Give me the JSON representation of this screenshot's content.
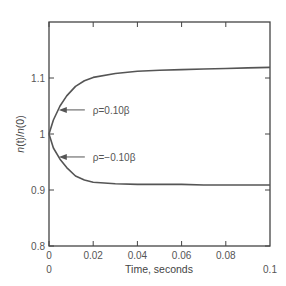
{
  "chart_data": {
    "type": "line",
    "title": "",
    "xlabel": "Time, seconds",
    "ylabel": "n(t)/n(0)",
    "xlim": [
      0,
      0.1
    ],
    "ylim": [
      0.8,
      1.2
    ],
    "x_ticks": [
      "0",
      "0.02",
      "0.04",
      "0.06",
      "0.08"
    ],
    "x_extra_labels": [
      "0",
      "0.1"
    ],
    "y_ticks": [
      "0.8",
      "0.9",
      "1",
      "1.1"
    ],
    "grid": false,
    "legend": "none (inline annotations)",
    "series": [
      {
        "name": "ρ=0.10β",
        "x": [
          0,
          0.002,
          0.005,
          0.008,
          0.012,
          0.016,
          0.02,
          0.03,
          0.04,
          0.05,
          0.06,
          0.07,
          0.08,
          0.09,
          0.1
        ],
        "values": [
          1.0,
          1.025,
          1.05,
          1.068,
          1.085,
          1.095,
          1.101,
          1.108,
          1.112,
          1.114,
          1.115,
          1.116,
          1.117,
          1.118,
          1.119
        ]
      },
      {
        "name": "ρ=−0.10β",
        "x": [
          0,
          0.002,
          0.005,
          0.008,
          0.012,
          0.016,
          0.02,
          0.03,
          0.04,
          0.05,
          0.06,
          0.07,
          0.08,
          0.09,
          0.1
        ],
        "values": [
          1.0,
          0.975,
          0.955,
          0.94,
          0.925,
          0.918,
          0.914,
          0.911,
          0.91,
          0.91,
          0.91,
          0.909,
          0.909,
          0.909,
          0.909
        ]
      }
    ],
    "annotations": [
      {
        "text": "ρ=0.10β",
        "arrow_to_x": 0.004,
        "arrow_to_y": 1.043
      },
      {
        "text": "ρ=−0.10β",
        "arrow_to_x": 0.004,
        "arrow_to_y": 0.959
      }
    ]
  },
  "labels": {
    "xlabel": "Time, seconds",
    "ylabel_n1": "n",
    "ylabel_t": "(t)/",
    "ylabel_n2": "n",
    "ylabel_0": "(0)",
    "annot_pos": "ρ=0.10β",
    "annot_neg": "ρ=−0.10β",
    "x0_below": "0",
    "x_end": "0.1"
  },
  "colors": {
    "axis": "#444444",
    "curve": "#555555",
    "text": "#555555"
  }
}
